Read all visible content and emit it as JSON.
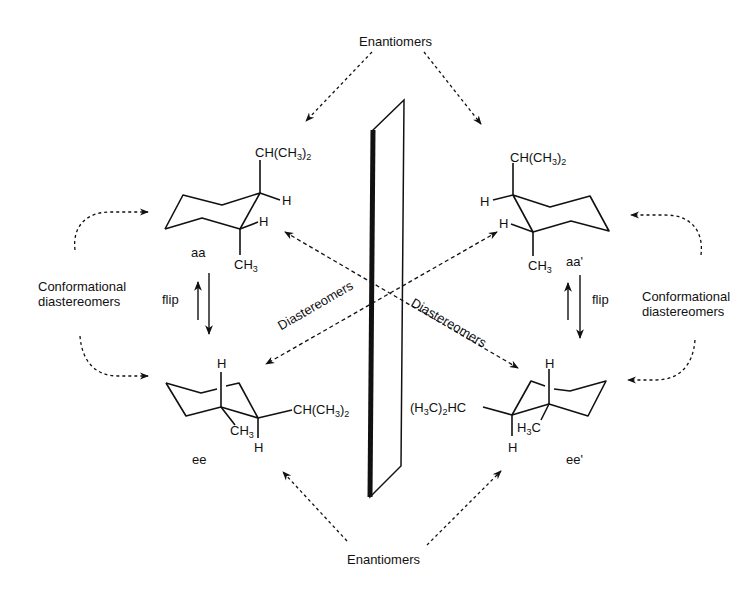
{
  "figure": {
    "type": "stereochemistry-diagram"
  },
  "labels": {
    "enantiomers_top": "Enantiomers",
    "enantiomers_bottom": "Enantiomers",
    "conf_left_line1": "Conformational",
    "conf_left_line2": "diastereomers",
    "conf_right_line1": "Conformational",
    "conf_right_line2": "diastereomers",
    "flip_left": "flip",
    "flip_right": "flip",
    "diastereomers_left": "Diastereomers",
    "diastereomers_right": "Diastereomers"
  },
  "molecules": {
    "aa": {
      "name": "aa",
      "isopropyl": "CH(CH",
      "isopropyl_sub": "3",
      "isopropyl_tail": ")",
      "isopropyl_sub2": "2",
      "h1": "H",
      "h2": "H",
      "methyl": "CH",
      "methyl_sub": "3"
    },
    "aa_prime": {
      "name": "aa'",
      "isopropyl": "CH(CH",
      "isopropyl_sub": "3",
      "isopropyl_tail": ")",
      "isopropyl_sub2": "2",
      "h1": "H",
      "h2": "H",
      "methyl": "CH",
      "methyl_sub": "3"
    },
    "ee": {
      "name": "ee",
      "isopropyl": "CH(CH",
      "isopropyl_sub": "3",
      "isopropyl_tail": ")",
      "isopropyl_sub2": "2",
      "h1": "H",
      "h2": "H",
      "methyl": "CH",
      "methyl_sub": "3"
    },
    "ee_prime": {
      "name": "ee'",
      "isopropyl_pre": "(H",
      "isopropyl_sub": "3",
      "isopropyl_mid": "C)",
      "isopropyl_sub2": "2",
      "isopropyl_tail": "HC",
      "h1": "H",
      "h2": "H",
      "methyl_pre": "H",
      "methyl_sub": "3",
      "methyl_tail": "C"
    }
  },
  "colors": {
    "ink": "#111111",
    "background": "#ffffff"
  }
}
